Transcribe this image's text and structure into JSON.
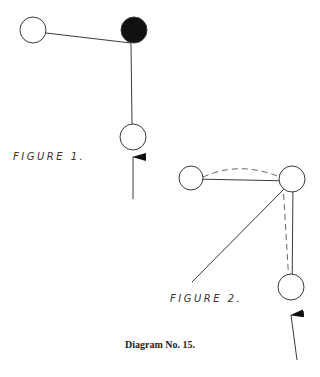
{
  "figures": [
    {
      "label": "FIGURE 1.",
      "label_pos": [
        13,
        160
      ],
      "nodes": [
        {
          "id": "left",
          "cx": 33,
          "cy": 30,
          "r": 13,
          "filled": false
        },
        {
          "id": "pivot",
          "cx": 134,
          "cy": 30,
          "r": 13,
          "filled": true
        },
        {
          "id": "bottom",
          "cx": 133,
          "cy": 137,
          "r": 13,
          "filled": false
        }
      ],
      "lines": [
        {
          "x1": 46,
          "y1": 33,
          "x2": 131,
          "y2": 43,
          "style": "solid"
        },
        {
          "x1": 131,
          "y1": 43,
          "x2": 132,
          "y2": 124,
          "style": "solid"
        }
      ],
      "arrow": {
        "x1": 133,
        "y1": 199,
        "x2": 133,
        "y2": 157
      }
    },
    {
      "label": "FIGURE 2.",
      "label_pos": [
        170,
        302
      ],
      "nodes": [
        {
          "id": "left",
          "cx": 191,
          "cy": 178,
          "r": 12,
          "filled": false
        },
        {
          "id": "pivot",
          "cx": 292,
          "cy": 179,
          "r": 13,
          "filled": false
        },
        {
          "id": "bottom",
          "cx": 291,
          "cy": 287,
          "r": 13,
          "filled": false
        }
      ],
      "lines": [
        {
          "x1": 193,
          "y1": 179,
          "x2": 293,
          "y2": 181,
          "style": "solid"
        },
        {
          "x1": 293,
          "y1": 181,
          "x2": 292,
          "y2": 300,
          "style": "solid"
        },
        {
          "x1": 283,
          "y1": 190,
          "x2": 192,
          "y2": 282,
          "style": "solid"
        },
        {
          "x1": 283,
          "y1": 184,
          "x2": 290,
          "y2": 300,
          "style": "dashed"
        }
      ],
      "arc": {
        "d": "M 203 177 Q 241 160 282 178",
        "style": "dashed"
      },
      "arrow": {
        "x1": 297,
        "y1": 360,
        "x2": 291,
        "y2": 315
      }
    }
  ],
  "caption": "Diagram No. 15.",
  "colors": {
    "stroke": "#3a3a3a",
    "fill": "#111111",
    "background": "#ffffff"
  }
}
